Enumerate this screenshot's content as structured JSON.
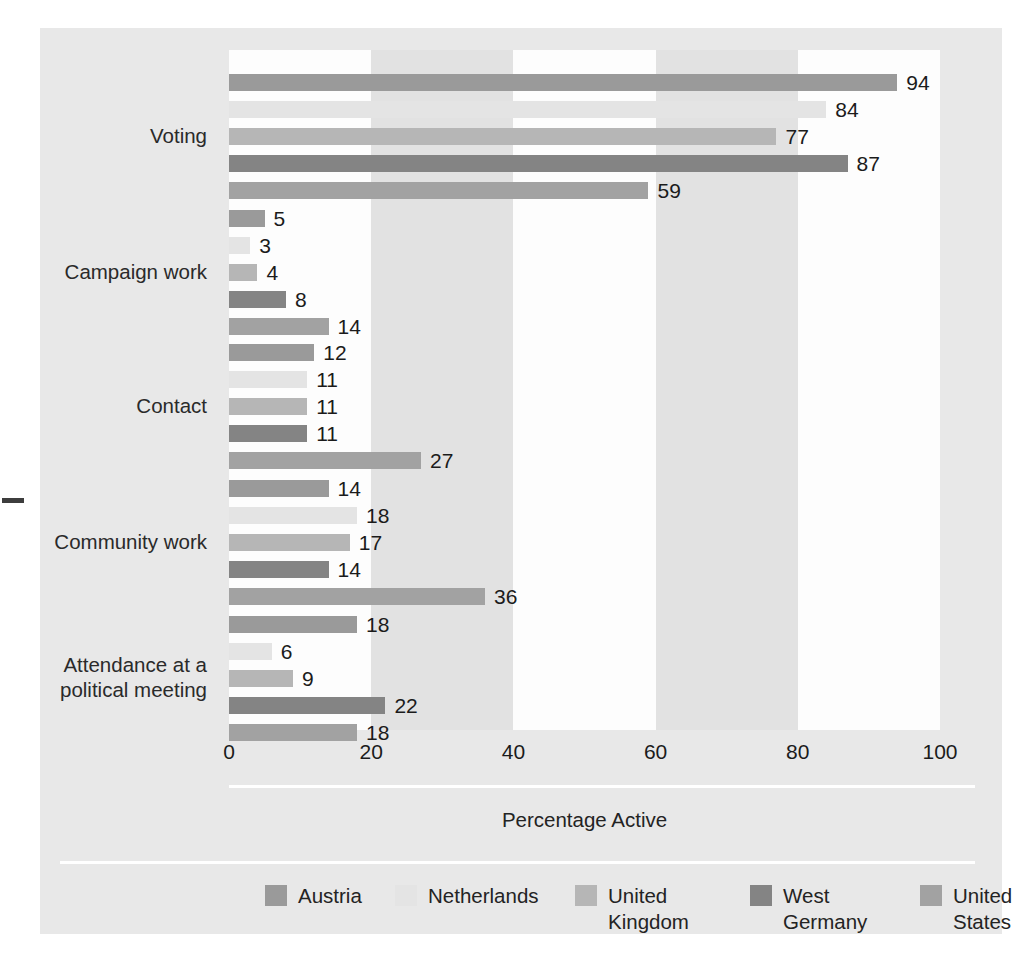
{
  "chart_data": {
    "type": "bar",
    "orientation": "horizontal",
    "title": "",
    "xlabel": "Percentage Active",
    "ylabel": "",
    "xlim": [
      0,
      100
    ],
    "xticks": [
      0,
      20,
      40,
      60,
      80,
      100
    ],
    "grid": false,
    "legend_position": "bottom",
    "categories": [
      "Voting",
      "Campaign work",
      "Contact",
      "Community work",
      "Attendance at a\npolitical meeting"
    ],
    "series": [
      {
        "name": "Austria",
        "color": "#9a9a9a",
        "values": [
          94,
          5,
          12,
          14,
          18
        ]
      },
      {
        "name": "Netherlands",
        "color": "#e4e4e4",
        "values": [
          84,
          3,
          11,
          18,
          6
        ]
      },
      {
        "name": "United\nKingdom",
        "color": "#b6b6b6",
        "values": [
          77,
          4,
          11,
          17,
          9
        ]
      },
      {
        "name": "West\nGermany",
        "color": "#848484",
        "values": [
          87,
          8,
          11,
          14,
          22
        ]
      },
      {
        "name": "United\nStates",
        "color": "#a2a2a2",
        "values": [
          59,
          14,
          27,
          36,
          18
        ]
      }
    ],
    "background_bands": [
      {
        "from": 0,
        "to": 20,
        "shade": "white"
      },
      {
        "from": 20,
        "to": 40,
        "shade": "gray"
      },
      {
        "from": 40,
        "to": 60,
        "shade": "white"
      },
      {
        "from": 60,
        "to": 80,
        "shade": "gray"
      },
      {
        "from": 80,
        "to": 100,
        "shade": "white"
      }
    ],
    "colors": {
      "panel_background": "#e8e8e8",
      "plot_band_white": "#fdfdfd",
      "plot_band_gray": "#e2e2e2",
      "value_label": "#1b1b1b",
      "axis_rule": "#ffffff"
    }
  }
}
